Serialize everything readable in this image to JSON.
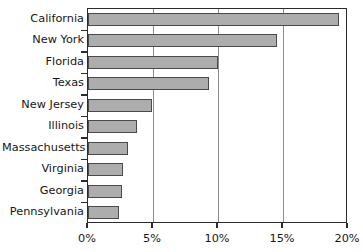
{
  "chart_data": {
    "type": "bar",
    "orientation": "horizontal",
    "title": "",
    "subtitle": "",
    "xlabel": "",
    "ylabel": "",
    "categories": [
      "California",
      "New York",
      "Florida",
      "Texas",
      "New Jersey",
      "Illinois",
      "Massachusetts",
      "Virginia",
      "Georgia",
      "Pennsylvania"
    ],
    "values": [
      19.3,
      14.5,
      10.0,
      9.3,
      4.9,
      3.8,
      3.1,
      2.7,
      2.6,
      2.4
    ],
    "value_unit": "%",
    "xlim": [
      0,
      20
    ],
    "xticks": [
      0,
      5,
      10,
      15,
      20
    ],
    "xtick_labels": [
      "0%",
      "5%",
      "10%",
      "15%",
      "20%"
    ],
    "gridlines": [
      5,
      10,
      15
    ],
    "grid": true,
    "legend": null,
    "annotations": [],
    "bar_fill_color": "#adadad",
    "bar_edge_color": "#4a4a4a",
    "axis_color": "#2b2b2b",
    "gridline_color": "#8d8d8d",
    "background_color": "#ffffff"
  }
}
